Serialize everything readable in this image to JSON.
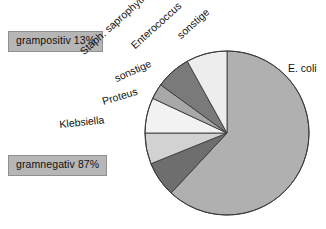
{
  "chart_data": {
    "type": "pie",
    "title": "",
    "subtitle": "",
    "xlabel": "",
    "ylabel": "",
    "legend_position": "none",
    "grid": false,
    "start_angle_deg": 0,
    "direction": "clockwise",
    "center": {
      "cx": 227,
      "cy": 133,
      "r": 82
    },
    "categories": [
      "E. coli",
      "sonstige",
      "Enterococcus",
      "Staph. saprophyticus",
      "sonstige",
      "Proteus",
      "Klebsiella"
    ],
    "values": [
      62,
      8,
      7,
      3,
      7,
      6,
      7
    ],
    "slices": [
      {
        "label": "E. coli",
        "value": 62,
        "color": "#b0b0b0",
        "start_deg": 0,
        "end_deg": 223
      },
      {
        "label": "Klebsiella",
        "value": 7,
        "color": "#6e6e6e",
        "start_deg": 223,
        "end_deg": 248
      },
      {
        "label": "Proteus",
        "value": 6,
        "color": "#d2d2d2",
        "start_deg": 248,
        "end_deg": 270
      },
      {
        "label": "sonstige",
        "value": 7,
        "color": "#f2f2f2",
        "start_deg": 270,
        "end_deg": 295
      },
      {
        "label": "Staph. saprophyticus",
        "value": 3,
        "color": "#a8a8a8",
        "start_deg": 295,
        "end_deg": 306
      },
      {
        "label": "Enterococcus",
        "value": 7,
        "color": "#7a7a7a",
        "start_deg": 306,
        "end_deg": 331
      },
      {
        "label": "sonstige",
        "value": 8,
        "color": "#ededed",
        "start_deg": 331,
        "end_deg": 360
      }
    ],
    "groups": [
      {
        "label": "grampositiv 13%",
        "percent": 13,
        "box_color": "#b6b6b6"
      },
      {
        "label": "gramnegativ 87%",
        "percent": 87,
        "box_color": "#b6b6b6"
      }
    ]
  },
  "groups": {
    "grampositiv": "grampositiv 13%",
    "gramnegativ": "gramnegativ 87%"
  },
  "labels": {
    "staph": "Staph. saprophyticus",
    "enterococcus": "Enterococcus",
    "sonstige_top": "sonstige",
    "sonstige_left": "sonstige",
    "proteus": "Proteus",
    "klebsiella": "Klebsiella",
    "ecoli": "E. coli"
  },
  "colors": {
    "pie_stroke": "#3a3a3a",
    "box_fill": "#b6b6b6",
    "box_border": "#8f8f8f",
    "text": "#111111",
    "background": "#ffffff"
  }
}
